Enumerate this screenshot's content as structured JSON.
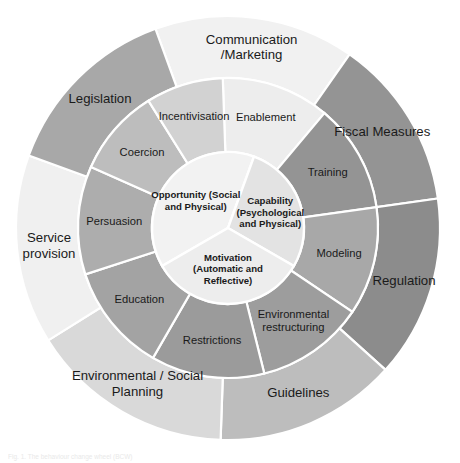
{
  "figure": {
    "title": "Behaviour Change Wheel",
    "caption": "Fig. 1. The behaviour change wheel (BCW)",
    "center_x": 228,
    "center_y": 228,
    "radius_outer": 212,
    "radius_mid": 150,
    "radius_core": 76,
    "background": "#ffffff",
    "divider_color": "#ffffff"
  },
  "core": {
    "name": "sources-of-behaviour",
    "segments": [
      {
        "id": "opportunity",
        "lines": [
          "Opportunity (Social",
          "and Physical)"
        ],
        "color": "#f2f2f2",
        "start_angle": 150,
        "end_angle": 290
      },
      {
        "id": "capability",
        "lines": [
          "Capability",
          "(Psychological",
          "and Physical)"
        ],
        "color": "#e3e3e3",
        "start_angle": 290,
        "end_angle": 30
      },
      {
        "id": "motivation",
        "lines": [
          "Motivation",
          "(Automatic and",
          "Reflective)"
        ],
        "color": "#ededed",
        "start_angle": 30,
        "end_angle": 150
      }
    ]
  },
  "middle_ring": {
    "name": "intervention-functions",
    "segments": [
      {
        "id": "enablement",
        "lines": [
          "Enablement"
        ],
        "color": "#ededed",
        "start_angle": 268,
        "end_angle": 310
      },
      {
        "id": "training",
        "lines": [
          "Training"
        ],
        "color": "#949494",
        "start_angle": 310,
        "end_angle": 352
      },
      {
        "id": "modeling",
        "lines": [
          "Modeling"
        ],
        "color": "#a8a8a8",
        "start_angle": 352,
        "end_angle": 34
      },
      {
        "id": "environmental-restructuring",
        "lines": [
          "Environmental",
          "restructuring"
        ],
        "color": "#9d9d9d",
        "start_angle": 34,
        "end_angle": 76
      },
      {
        "id": "restrictions",
        "lines": [
          "Restrictions"
        ],
        "color": "#9b9b9b",
        "start_angle": 76,
        "end_angle": 120
      },
      {
        "id": "education",
        "lines": [
          "Education"
        ],
        "color": "#a3a3a3",
        "start_angle": 120,
        "end_angle": 162
      },
      {
        "id": "persuasion",
        "lines": [
          "Persuasion"
        ],
        "color": "#adadad",
        "start_angle": 162,
        "end_angle": 204
      },
      {
        "id": "coercion",
        "lines": [
          "Coercion"
        ],
        "color": "#bdbdbd",
        "start_angle": 204,
        "end_angle": 238
      },
      {
        "id": "incentivisation",
        "lines": [
          "Incentivisation"
        ],
        "color": "#d2d2d2",
        "start_angle": 238,
        "end_angle": 268
      }
    ]
  },
  "outer_ring": {
    "name": "policy-categories",
    "segments": [
      {
        "id": "communication-marketing",
        "lines": [
          "Communication",
          "/Marketing"
        ],
        "color": "#f1f1f1",
        "start_angle": 250,
        "end_angle": 305
      },
      {
        "id": "fiscal-measures",
        "lines": [
          "Fiscal Measures"
        ],
        "color": "#949494",
        "start_angle": 305,
        "end_angle": 352
      },
      {
        "id": "regulation",
        "lines": [
          "Regulation"
        ],
        "color": "#8c8c8c",
        "start_angle": 352,
        "end_angle": 42
      },
      {
        "id": "guidelines",
        "lines": [
          "Guidelines"
        ],
        "color": "#bdbdbd",
        "start_angle": 42,
        "end_angle": 92
      },
      {
        "id": "environmental-social-planning",
        "lines": [
          "Environmental / Social",
          "Planning"
        ],
        "color": "#d9d9d9",
        "start_angle": 92,
        "end_angle": 148
      },
      {
        "id": "service-provision",
        "lines": [
          "Service",
          "provision"
        ],
        "color": "#f0f0f0",
        "start_angle": 148,
        "end_angle": 200
      },
      {
        "id": "legislation",
        "lines": [
          "Legislation"
        ],
        "color": "#a8a8a8",
        "start_angle": 200,
        "end_angle": 250
      }
    ]
  }
}
